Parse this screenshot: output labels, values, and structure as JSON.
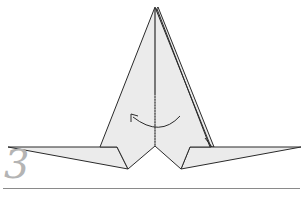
{
  "diagram": {
    "type": "origami-step",
    "step_number": "3",
    "instruction_symbols": [
      "valley-fold-line",
      "fold-arrow-left"
    ],
    "colors": {
      "paper": "#ebebeb",
      "outline": "#2a2a2a",
      "step_number": "#b4b4b4",
      "rule": "#8a8a8a"
    }
  }
}
